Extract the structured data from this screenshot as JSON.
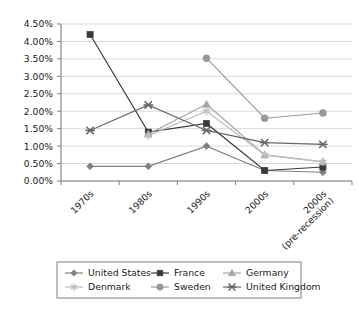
{
  "chart_data": {
    "type": "line",
    "title": "",
    "xlabel": "",
    "ylabel": "",
    "ylim": [
      0,
      4.5
    ],
    "ytick_step": 0.5,
    "grid": true,
    "legend_position": "bottom",
    "ytick_labels": [
      "0.00%",
      "0.50%",
      "1.00%",
      "1.50%",
      "2.00%",
      "2.50%",
      "3.00%",
      "3.50%",
      "4.00%",
      "4.50%"
    ],
    "ytick_values": [
      0,
      0.5,
      1.0,
      1.5,
      2.0,
      2.5,
      3.0,
      3.5,
      4.0,
      4.5
    ],
    "categories": [
      "1970s",
      "1980s",
      "1990s",
      "2000s",
      "2000s (pre-recession)"
    ],
    "category_labels": [
      {
        "line1": "1970s",
        "line2": ""
      },
      {
        "line1": "1980s",
        "line2": ""
      },
      {
        "line1": "1990s",
        "line2": ""
      },
      {
        "line1": "2000s",
        "line2": ""
      },
      {
        "line1": "2000s",
        "line2": "(pre-recession)"
      }
    ],
    "series": [
      {
        "name": "United States",
        "marker": "diamond",
        "color": "#808080",
        "values": [
          0.42,
          0.42,
          1.0,
          0.3,
          0.25
        ]
      },
      {
        "name": "France",
        "marker": "square",
        "color": "#3a3a3a",
        "values": [
          4.2,
          1.4,
          1.65,
          0.3,
          0.4
        ]
      },
      {
        "name": "Germany",
        "marker": "triangle",
        "color": "#a6a6a6",
        "values": [
          null,
          1.35,
          2.2,
          0.75,
          0.55
        ]
      },
      {
        "name": "Denmark",
        "marker": "star",
        "color": "#bfbfbf",
        "values": [
          null,
          1.3,
          2.0,
          0.75,
          0.55
        ]
      },
      {
        "name": "Sweden",
        "marker": "circle",
        "color": "#999999",
        "values": [
          null,
          null,
          3.52,
          1.8,
          1.95
        ]
      },
      {
        "name": "United Kingdom",
        "marker": "cross",
        "color": "#666666",
        "values": [
          1.45,
          2.18,
          1.45,
          1.1,
          1.05
        ]
      }
    ]
  },
  "legend": {
    "entries": [
      {
        "label": "United States",
        "marker": "diamond",
        "color": "#808080"
      },
      {
        "label": "France",
        "marker": "square",
        "color": "#3a3a3a"
      },
      {
        "label": "Germany",
        "marker": "triangle",
        "color": "#a6a6a6"
      },
      {
        "label": "Denmark",
        "marker": "star",
        "color": "#bfbfbf"
      },
      {
        "label": "Sweden",
        "marker": "circle",
        "color": "#999999"
      },
      {
        "label": "United Kingdom",
        "marker": "cross",
        "color": "#666666"
      }
    ]
  }
}
